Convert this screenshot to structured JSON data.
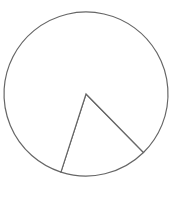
{
  "chart_data": {
    "type": "pie",
    "title": "",
    "categories": [
      "A",
      "B"
    ],
    "values": [
      17.3,
      82.7
    ],
    "labels_visible": false,
    "legend": false,
    "start_angle_deg": 45.5,
    "colors": {
      "fill": "#ffffff",
      "stroke": "#666666"
    },
    "center": [
      86,
      94
    ],
    "radius": 82
  }
}
